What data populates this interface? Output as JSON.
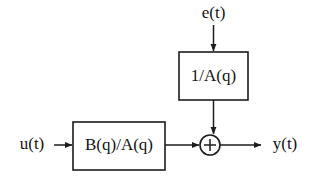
{
  "diagram": {
    "type": "block-diagram",
    "background_color": "#ffffff",
    "line_color": "#1c1c1c",
    "text_color": "#141414",
    "blocks": [
      {
        "id": "noise-filter",
        "label": "1/A(q)",
        "x": 179,
        "y": 52,
        "width": 69,
        "height": 48
      },
      {
        "id": "plant",
        "label": "B(q)/A(q)",
        "x": 73,
        "y": 122,
        "width": 92,
        "height": 48
      }
    ],
    "summing_junction": {
      "id": "adder",
      "symbol": "+",
      "cx": 210,
      "cy": 145,
      "r": 10
    },
    "signals": {
      "input": "u(t)",
      "noise": "e(t)",
      "output": "y(t)"
    },
    "connections": [
      {
        "from": "e(t)",
        "to": "1/A(q)",
        "direction": "down"
      },
      {
        "from": "1/A(q)",
        "to": "adder",
        "direction": "down"
      },
      {
        "from": "u(t)",
        "to": "B(q)/A(q)",
        "direction": "right"
      },
      {
        "from": "B(q)/A(q)",
        "to": "adder",
        "direction": "right"
      },
      {
        "from": "adder",
        "to": "y(t)",
        "direction": "right"
      }
    ]
  }
}
